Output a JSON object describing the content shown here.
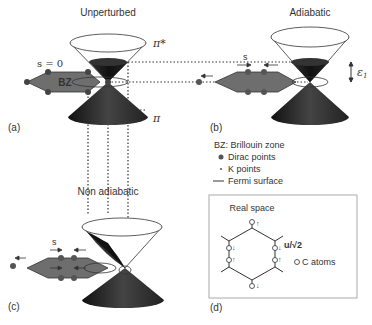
{
  "panels": {
    "a": {
      "title": "Unperturbed",
      "label": "(a)",
      "s_label": "s = 0",
      "bz_label": "BZ",
      "pi_star": "π*",
      "pi": "π"
    },
    "b": {
      "title": "Adiabatic",
      "label": "(b)",
      "s_label": "s",
      "epsilon_label": "ε",
      "epsilon_sub": "1"
    },
    "c": {
      "title": "Non adiabatic",
      "label": "(c)",
      "s_label": "s"
    },
    "d": {
      "title": "Real space",
      "label": "(d)",
      "u_label": "u/√2",
      "c_atoms_label": "C atoms"
    }
  },
  "legend": {
    "items": [
      {
        "symbol": "",
        "text": "BZ: Brillouin zone"
      },
      {
        "symbol": "large-dot",
        "text": "Dirac points"
      },
      {
        "symbol": "small-dot",
        "text": "K points"
      },
      {
        "symbol": "line",
        "text": "Fermi surface"
      }
    ]
  },
  "colors": {
    "cone_dark": "#1a1a1a",
    "cone_mid": "#555555",
    "bz_fill": "#6e6e6e",
    "dot": "#555555",
    "text": "#333333"
  }
}
